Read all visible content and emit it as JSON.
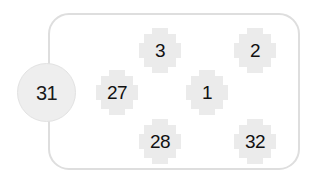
{
  "diagram": {
    "background_color": "#ffffff",
    "panel": {
      "name": "fuse-panel",
      "border_color": "#dedede",
      "fill_color": "#ffffff"
    },
    "badge": {
      "label": "31",
      "fill_color": "#eeeeee",
      "border_color": "#e2e2e2",
      "text_color": "#1a1a1a"
    },
    "tile_style": {
      "fill_color": "#ebebeb",
      "text_color": "#111111"
    },
    "tiles": [
      {
        "id": "tile-3",
        "label": "3",
        "row": "top",
        "column": "middle"
      },
      {
        "id": "tile-2",
        "label": "2",
        "row": "top",
        "column": "right"
      },
      {
        "id": "tile-27",
        "label": "27",
        "row": "middle",
        "column": "left"
      },
      {
        "id": "tile-1",
        "label": "1",
        "row": "middle",
        "column": "center"
      },
      {
        "id": "tile-28",
        "label": "28",
        "row": "bottom",
        "column": "middle"
      },
      {
        "id": "tile-32",
        "label": "32",
        "row": "bottom",
        "column": "right"
      }
    ]
  }
}
